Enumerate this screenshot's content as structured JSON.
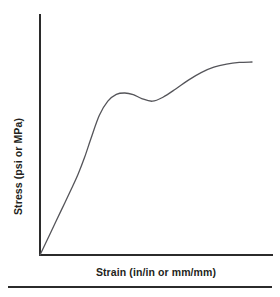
{
  "figure": {
    "name": "stress-strain-curve-figure",
    "background_color": "#ffffff",
    "axis_color": "#2b2b2b",
    "curve_color": "#55555a",
    "text_color": "#231f20"
  },
  "chart_data": {
    "type": "line",
    "title": "",
    "subtitle": "",
    "xlabel": "Strain (in/in or mm/mm)",
    "ylabel": "Stress (psi or MPa)",
    "xlim": [
      0,
      1
    ],
    "ylim": [
      0,
      1
    ],
    "grid": false,
    "legend": null,
    "legend_position": "none",
    "xticks": [],
    "yticks": [],
    "xticklabels": [],
    "yticklabels": [],
    "annotations": [],
    "series": [
      {
        "name": "Stress-strain response",
        "description": "Linear elastic rise, upper yield peak, slight yield drop, then strain hardening to a flattening plateau",
        "x": [
          0.0,
          0.05,
          0.1,
          0.15,
          0.18,
          0.21,
          0.24,
          0.28,
          0.32,
          0.36,
          0.4,
          0.44,
          0.48,
          0.53,
          0.58,
          0.64,
          0.7,
          0.76,
          0.82,
          0.88,
          0.94,
          1.0
        ],
        "y": [
          0.0,
          0.095,
          0.19,
          0.285,
          0.345,
          0.415,
          0.495,
          0.595,
          0.655,
          0.684,
          0.69,
          0.683,
          0.666,
          0.655,
          0.672,
          0.707,
          0.745,
          0.777,
          0.8,
          0.813,
          0.82,
          0.822
        ]
      }
    ],
    "key_points": {
      "origin": {
        "x": 0.0,
        "y": 0.0
      },
      "proportional_limit": {
        "x": 0.24,
        "y": 0.495
      },
      "upper_yield_peak": {
        "x": 0.4,
        "y": 0.69
      },
      "lower_yield_dip": {
        "x": 0.53,
        "y": 0.655
      },
      "ultimate_plateau": {
        "x": 1.0,
        "y": 0.822
      }
    }
  },
  "axes": {
    "y_axis_name": "y-axis-line",
    "x_axis_name": "x-axis-line"
  },
  "footer": {
    "rule_name": "bottom-divider-rule"
  }
}
